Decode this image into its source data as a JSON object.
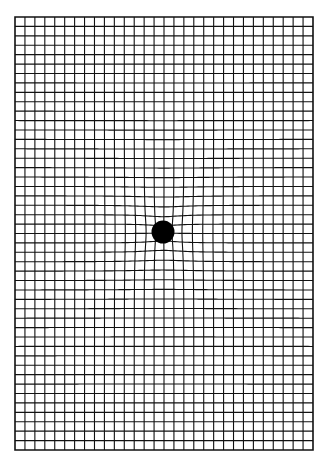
{
  "diagram": {
    "title": "",
    "canvas": {
      "width": 327,
      "height": 462,
      "background": "#ffffff"
    },
    "grid": {
      "left": 15,
      "top": 17,
      "right": 313,
      "bottom": 450,
      "columns": 30,
      "rows": 46,
      "line_color": "#111111",
      "line_width": 1.1,
      "border_width": 1.6
    },
    "mass": {
      "label": "",
      "cx": 163,
      "cy": 232,
      "r": 11.5,
      "color": "#000000"
    },
    "warp": {
      "strength": 2600,
      "softening": 22
    }
  }
}
